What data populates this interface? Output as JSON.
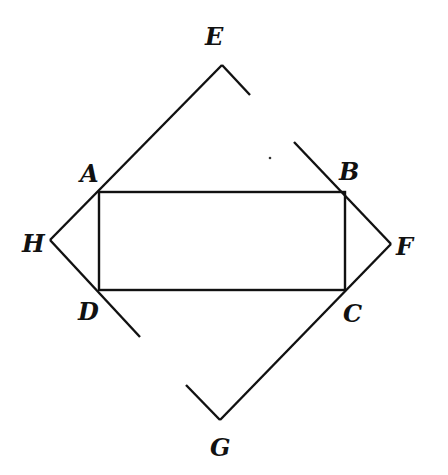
{
  "figure": {
    "clipped_text_top": "",
    "labels": {
      "A": "A",
      "B": "B",
      "C": "C",
      "D": "D",
      "E": "E",
      "F": "F",
      "G": "G",
      "H": "H"
    },
    "points": {
      "A": [
        99,
        192
      ],
      "B": [
        344,
        193
      ],
      "C": [
        345,
        290
      ],
      "D": [
        99,
        289
      ],
      "E": [
        222,
        65
      ],
      "F": [
        391,
        244
      ],
      "G": [
        220,
        420
      ],
      "H": [
        50,
        240
      ]
    },
    "stroke_color": "#111111",
    "background": "#ffffff"
  }
}
